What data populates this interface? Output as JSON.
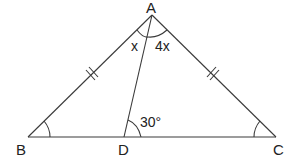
{
  "diagram": {
    "points": {
      "A": {
        "label": "A",
        "x": 152,
        "y": 15
      },
      "B": {
        "label": "B",
        "x": 28,
        "y": 137
      },
      "C": {
        "label": "C",
        "x": 276,
        "y": 137
      },
      "D": {
        "label": "D",
        "x": 124,
        "y": 137
      }
    },
    "segments": [
      "AB",
      "AC",
      "BC",
      "AD"
    ],
    "equal_marks": {
      "AB": "double-tick",
      "AC": "double-tick"
    },
    "angle_labels": {
      "BAD": "x",
      "DAC": "4x",
      "ADC": "30°"
    },
    "angle_arcs": [
      "B",
      "C",
      "BAD",
      "DAC",
      "ADC"
    ],
    "colors": {
      "stroke": "#3a3a3a",
      "text": "#222222",
      "background": "#ffffff"
    }
  }
}
